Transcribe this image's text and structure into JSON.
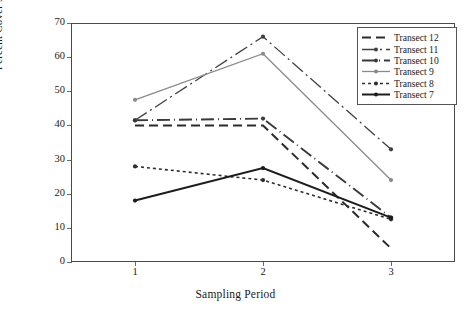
{
  "chart_data": {
    "type": "line",
    "title": "",
    "xlabel": "Sampling Period",
    "ylabel": "Percent Cover Seagrass",
    "x": [
      1,
      2,
      3
    ],
    "categories": [
      "1",
      "2",
      "3"
    ],
    "xtick_labels": [
      "1",
      "2",
      "3"
    ],
    "ytick_labels": [
      "0",
      "10",
      "20",
      "30",
      "40",
      "50",
      "60",
      "70"
    ],
    "yticks": [
      0,
      10,
      20,
      30,
      40,
      50,
      60,
      70
    ],
    "ylim": [
      0,
      70
    ],
    "xlim": [
      0.5,
      3.5
    ],
    "grid": false,
    "legend_position": "top-right",
    "series": [
      {
        "name": "Transect 12",
        "values": [
          40,
          40,
          4
        ],
        "color": "#2b2b2b",
        "dash": "9,5",
        "width": 2.0,
        "marker": "none"
      },
      {
        "name": "Transect 11",
        "values": [
          41.5,
          66,
          33
        ],
        "color": "#404040",
        "dash": "14,4,2,4",
        "width": 1.3,
        "marker": "dot"
      },
      {
        "name": "Transect 10",
        "values": [
          41.5,
          42,
          13
        ],
        "color": "#3a3a3a",
        "dash": "13,4,1,4",
        "width": 1.9,
        "marker": "dot"
      },
      {
        "name": "Transect 9",
        "values": [
          47.5,
          61,
          24
        ],
        "color": "#8a8a8a",
        "dash": "none",
        "width": 1.3,
        "marker": "dot"
      },
      {
        "name": "Transect 8",
        "values": [
          28,
          24,
          12.5
        ],
        "color": "#2e2e2e",
        "dash": "3,3",
        "width": 1.6,
        "marker": "dot"
      },
      {
        "name": "Transect 7",
        "values": [
          18,
          27.5,
          13
        ],
        "color": "#1c1c1c",
        "dash": "none",
        "width": 2.0,
        "marker": "dot"
      }
    ]
  },
  "legend": {
    "items": [
      {
        "label": "Transect 12"
      },
      {
        "label": "Transect 11"
      },
      {
        "label": "Transect 10"
      },
      {
        "label": "Transect 9"
      },
      {
        "label": "Transect 8"
      },
      {
        "label": "Transect 7"
      }
    ]
  },
  "axes": {
    "y_title": "Percent Cover Seagrass",
    "x_title": "Sampling Period"
  }
}
